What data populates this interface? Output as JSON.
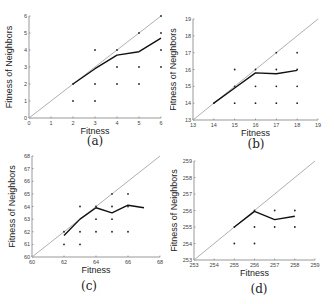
{
  "figure": {
    "captions": [
      "(a)",
      "(b)",
      "(c)",
      "(d)"
    ]
  },
  "chart_data": [
    {
      "type": "line",
      "panel": "(a)",
      "title": "",
      "xlabel": "Fitness",
      "ylabel": "Fitness of Neighbors",
      "xlim": [
        0,
        6
      ],
      "ylim": [
        0,
        6
      ],
      "xticks": [
        0,
        1,
        2,
        3,
        4,
        5,
        6
      ],
      "yticks": [
        0,
        1,
        2,
        3,
        4,
        5,
        6
      ],
      "grid": false,
      "series": [
        {
          "name": "diagonal",
          "color": "#b0b0b0",
          "x": [
            0,
            6
          ],
          "y": [
            0,
            6
          ]
        },
        {
          "name": "mean neighbor fitness",
          "color": "#111111",
          "x": [
            2,
            3,
            4,
            5,
            6
          ],
          "y": [
            2,
            2.9,
            3.7,
            3.9,
            4.7
          ]
        }
      ],
      "points": [
        [
          2,
          1
        ],
        [
          2,
          2
        ],
        [
          3,
          1
        ],
        [
          3,
          2
        ],
        [
          3,
          4
        ],
        [
          4,
          2
        ],
        [
          4,
          3
        ],
        [
          4,
          4
        ],
        [
          5,
          2
        ],
        [
          5,
          3
        ],
        [
          5,
          5
        ],
        [
          6,
          3
        ],
        [
          6,
          4
        ],
        [
          6,
          5
        ],
        [
          6,
          6
        ]
      ]
    },
    {
      "type": "line",
      "panel": "(b)",
      "title": "",
      "xlabel": "Fitness",
      "ylabel": "Fitness of Neighbors",
      "xlim": [
        13,
        19
      ],
      "ylim": [
        13,
        19
      ],
      "xticks": [
        13,
        14,
        15,
        16,
        17,
        18,
        19
      ],
      "yticks": [
        13,
        14,
        15,
        16,
        17,
        18,
        19
      ],
      "grid": false,
      "series": [
        {
          "name": "diagonal",
          "color": "#b0b0b0",
          "x": [
            13,
            19
          ],
          "y": [
            13,
            19
          ]
        },
        {
          "name": "mean neighbor fitness",
          "color": "#111111",
          "x": [
            14,
            15,
            16,
            17,
            18
          ],
          "y": [
            14,
            14.9,
            15.8,
            15.75,
            15.95
          ]
        }
      ],
      "points": [
        [
          14,
          14
        ],
        [
          15,
          14
        ],
        [
          15,
          15
        ],
        [
          15,
          16
        ],
        [
          16,
          14
        ],
        [
          16,
          15
        ],
        [
          16,
          16
        ],
        [
          17,
          14
        ],
        [
          17,
          15
        ],
        [
          17,
          16
        ],
        [
          17,
          17
        ],
        [
          18,
          14
        ],
        [
          18,
          15
        ],
        [
          18,
          16
        ],
        [
          18,
          17
        ]
      ]
    },
    {
      "type": "line",
      "panel": "(c)",
      "title": "",
      "xlabel": "Fitness",
      "ylabel": "Fitness of Neighbors",
      "xlim": [
        60,
        68
      ],
      "ylim": [
        60,
        68
      ],
      "xticks": [
        60,
        62,
        64,
        66,
        68
      ],
      "yticks": [
        60,
        61,
        62,
        63,
        64,
        65,
        66,
        67,
        68
      ],
      "grid": false,
      "series": [
        {
          "name": "diagonal",
          "color": "#b0b0b0",
          "x": [
            60,
            68
          ],
          "y": [
            60,
            68
          ]
        },
        {
          "name": "mean neighbor fitness",
          "color": "#111111",
          "x": [
            62,
            63,
            64,
            65,
            66,
            67
          ],
          "y": [
            61.7,
            63,
            63.9,
            63.5,
            64.1,
            63.9
          ]
        }
      ],
      "points": [
        [
          62,
          61
        ],
        [
          62,
          62
        ],
        [
          63,
          61
        ],
        [
          63,
          62
        ],
        [
          63,
          64
        ],
        [
          64,
          62
        ],
        [
          64,
          63
        ],
        [
          64,
          64
        ],
        [
          65,
          62
        ],
        [
          65,
          63
        ],
        [
          65,
          64
        ],
        [
          65,
          65
        ],
        [
          66,
          62
        ],
        [
          66,
          64
        ],
        [
          66,
          65
        ]
      ]
    },
    {
      "type": "line",
      "panel": "(d)",
      "title": "",
      "xlabel": "Fitness",
      "ylabel": "Fitness of Neighbors",
      "xlim": [
        253,
        259
      ],
      "ylim": [
        253,
        259
      ],
      "xticks": [
        253,
        254,
        255,
        256,
        257,
        258,
        259
      ],
      "yticks": [
        253,
        254,
        255,
        256,
        257,
        258,
        259
      ],
      "grid": false,
      "series": [
        {
          "name": "diagonal",
          "color": "#b0b0b0",
          "x": [
            253,
            259
          ],
          "y": [
            253,
            259
          ]
        },
        {
          "name": "mean neighbor fitness",
          "color": "#111111",
          "x": [
            255,
            256,
            257,
            258
          ],
          "y": [
            255,
            255.95,
            255.45,
            255.65
          ]
        }
      ],
      "points": [
        [
          255,
          254
        ],
        [
          255,
          255
        ],
        [
          256,
          254
        ],
        [
          256,
          255
        ],
        [
          256,
          256
        ],
        [
          257,
          255
        ],
        [
          257,
          256
        ],
        [
          258,
          255
        ],
        [
          258,
          256
        ]
      ]
    }
  ]
}
